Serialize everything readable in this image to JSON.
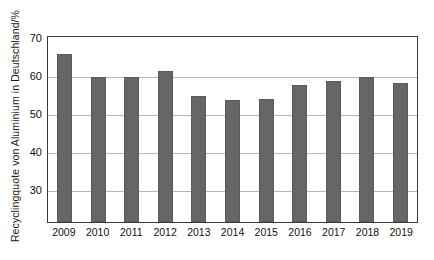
{
  "chart_data": {
    "type": "bar",
    "title": "",
    "xlabel": "",
    "ylabel": "Recyclingquote von Aluminium in Deutschland/%",
    "categories": [
      "2009",
      "2010",
      "2011",
      "2012",
      "2013",
      "2014",
      "2015",
      "2016",
      "2017",
      "2018",
      "2019"
    ],
    "values": [
      66,
      60,
      60,
      61.5,
      55,
      54,
      54.3,
      58,
      59,
      60,
      58.5
    ],
    "series": [
      {
        "name": "Recyclingquote von Aluminium in Deutschland/%",
        "values": [
          66,
          60,
          60,
          61.5,
          55,
          54,
          54.3,
          58,
          59,
          60,
          58.5
        ]
      }
    ],
    "ylim": [
      22,
      70.5
    ],
    "yticks": [
      30,
      40,
      50,
      60,
      70
    ],
    "ytick_labels": [
      "30",
      "40",
      "50",
      "60",
      "70"
    ],
    "grid": true,
    "legend": false,
    "bar_color": "#666666",
    "gridline_color": "#b7b7b7",
    "frame_color": "#3a3a3a"
  },
  "axes": {
    "y_title": "Recyclingquote von Aluminium in Deutschland/%",
    "y_ticks": [
      {
        "label": "70",
        "value": 70
      },
      {
        "label": "60",
        "value": 60
      },
      {
        "label": "50",
        "value": 50
      },
      {
        "label": "40",
        "value": 40
      },
      {
        "label": "30",
        "value": 30
      }
    ],
    "x_ticks": [
      "2009",
      "2010",
      "2011",
      "2012",
      "2013",
      "2014",
      "2015",
      "2016",
      "2017",
      "2018",
      "2019"
    ]
  },
  "caption": {
    "sliver_text": ""
  }
}
